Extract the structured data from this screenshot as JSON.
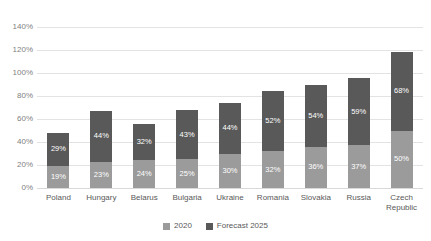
{
  "chart_data": {
    "type": "bar",
    "stacked": true,
    "title": "",
    "subtitle": "",
    "xlabel": "",
    "ylabel": "",
    "ylim": [
      0,
      140
    ],
    "ytick_labels": [
      "140%",
      "120%",
      "100%",
      "80%",
      "60%",
      "40%",
      "20%",
      "0%"
    ],
    "ytick_values": [
      140,
      120,
      100,
      80,
      60,
      40,
      20,
      0
    ],
    "grid": true,
    "legend_position": "bottom",
    "categories": [
      "Poland",
      "Hungary",
      "Belarus",
      "Bulgaria",
      "Ukraine",
      "Romania",
      "Slovakia",
      "Russia",
      "Czech Republic"
    ],
    "series": [
      {
        "name": "2020",
        "color": "#9b9b9b",
        "values": [
          19,
          23,
          24,
          25,
          30,
          32,
          36,
          37,
          50
        ],
        "labels": [
          "19%",
          "23%",
          "24%",
          "25%",
          "30%",
          "32%",
          "36%",
          "37%",
          "50%"
        ]
      },
      {
        "name": "Forecast 2025",
        "color": "#595959",
        "values": [
          29,
          44,
          32,
          43,
          44,
          52,
          54,
          59,
          68
        ],
        "labels": [
          "29%",
          "44%",
          "32%",
          "43%",
          "44%",
          "52%",
          "54%",
          "59%",
          "68%"
        ]
      }
    ],
    "totals": [
      48,
      67,
      56,
      68,
      74,
      84,
      90,
      96,
      118
    ]
  },
  "legend": {
    "items": [
      {
        "label": "2020",
        "color": "#9b9b9b"
      },
      {
        "label": "Forecast 2025",
        "color": "#595959"
      }
    ]
  },
  "colors": {
    "background": "#ffffff",
    "gridline": "#e3e3e3",
    "axis_text": "#7f7f7f",
    "category_text": "#595959",
    "data_label_text": "#ffffff"
  }
}
